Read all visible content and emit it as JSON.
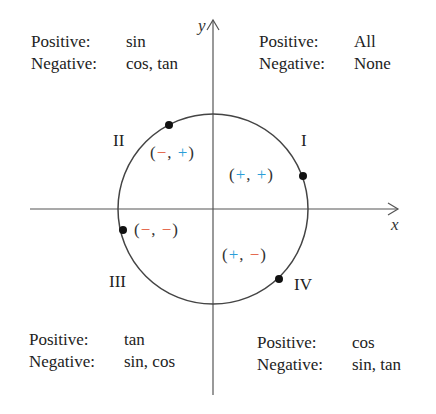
{
  "axes": {
    "x_label": "x",
    "y_label": "y"
  },
  "colors": {
    "positive": "#2a9fd8",
    "negative": "#e04a2a",
    "ink": "#222222"
  },
  "quadrants": [
    {
      "id": "I",
      "label": "I",
      "positive_label": "Positive:",
      "positive": "All",
      "negative_label": "Negative:",
      "negative": "None",
      "sign_x": "+",
      "sign_y": "+"
    },
    {
      "id": "II",
      "label": "II",
      "positive_label": "Positive:",
      "positive": "sin",
      "negative_label": "Negative:",
      "negative": "cos, tan",
      "sign_x": "−",
      "sign_y": "+"
    },
    {
      "id": "III",
      "label": "III",
      "positive_label": "Positive:",
      "positive": "tan",
      "negative_label": "Negative:",
      "negative": "sin, cos",
      "sign_x": "−",
      "sign_y": "−"
    },
    {
      "id": "IV",
      "label": "IV",
      "positive_label": "Positive:",
      "positive": "cos",
      "negative_label": "Negative:",
      "negative": "sin, tan",
      "sign_x": "+",
      "sign_y": "−"
    }
  ],
  "punct": {
    "open": "(",
    "comma": ",",
    "close": ")"
  }
}
